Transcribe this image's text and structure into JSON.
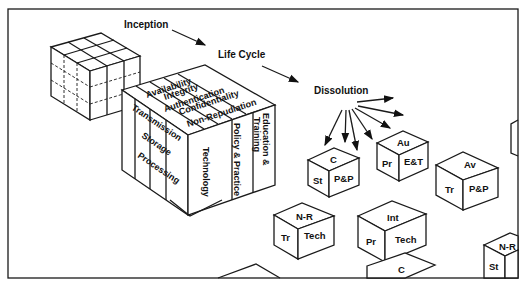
{
  "phases": {
    "inception": "Inception",
    "life_cycle": "Life Cycle",
    "dissolution": "Dissolution"
  },
  "main_cube": {
    "top_labels": [
      "Availability",
      "Integrity",
      "Authentication",
      "Confidentiality",
      "Non-Repudiation"
    ],
    "left_labels": [
      "Transmission",
      "Storage",
      "Processing"
    ],
    "front_labels": [
      "Technology",
      "Policy & Practice",
      "Education &",
      "Training"
    ]
  },
  "small_cubes": [
    {
      "top": "C",
      "left": "St",
      "right": "P&P"
    },
    {
      "top": "Au",
      "left": "Pr",
      "right": "E&T"
    },
    {
      "top": "Av",
      "left": "Tr",
      "right": "P&P"
    },
    {
      "top": "N-R",
      "left": "Tr",
      "right": "Tech"
    },
    {
      "top": "Int",
      "left": "Pr",
      "right": "Tech"
    },
    {
      "top": "C",
      "left": "",
      "right": ""
    },
    {
      "top": "N-R",
      "left": "St",
      "right": ""
    }
  ]
}
